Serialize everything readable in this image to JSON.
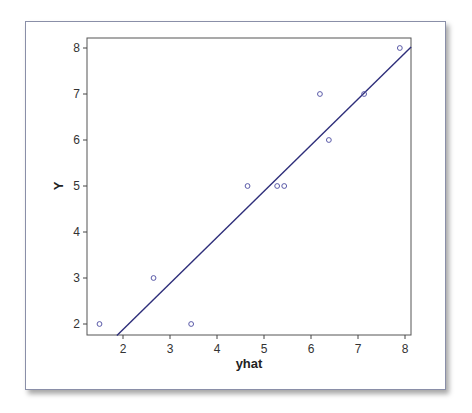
{
  "chart_data": {
    "type": "scatter",
    "title": "",
    "xlabel": "yhat",
    "ylabel": "Y",
    "xlim": [
      1.25,
      8.13
    ],
    "ylim": [
      1.75,
      8.2
    ],
    "x_ticks": [
      "2",
      "3",
      "4",
      "5",
      "6",
      "7",
      "8"
    ],
    "y_ticks": [
      "2",
      "3",
      "4",
      "5",
      "6",
      "7",
      "8"
    ],
    "grid": false,
    "legend": null,
    "series": [
      {
        "name": "observations",
        "marker": "open-circle",
        "color": "#5a5aa8",
        "points": [
          {
            "x": 1.5,
            "y": 2
          },
          {
            "x": 2.65,
            "y": 3
          },
          {
            "x": 3.45,
            "y": 2
          },
          {
            "x": 4.65,
            "y": 5
          },
          {
            "x": 5.28,
            "y": 5
          },
          {
            "x": 5.43,
            "y": 5
          },
          {
            "x": 6.19,
            "y": 7
          },
          {
            "x": 6.38,
            "y": 6
          },
          {
            "x": 7.13,
            "y": 7
          },
          {
            "x": 7.89,
            "y": 8
          }
        ]
      },
      {
        "name": "fitted line",
        "type": "line",
        "color": "#2e2e7a",
        "points": [
          {
            "x": 1.87,
            "y": 1.75
          },
          {
            "x": 8.13,
            "y": 8.02
          }
        ]
      }
    ]
  },
  "colors": {
    "axis": "#333333",
    "marker": "#5a5aa8",
    "line": "#2e2e7a"
  }
}
